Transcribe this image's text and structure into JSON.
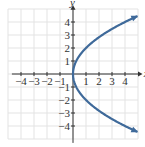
{
  "chart_data": {
    "type": "line",
    "title": "",
    "xlabel": "x",
    "ylabel": "y",
    "xlim": [
      -5,
      5
    ],
    "ylim": [
      -5,
      5
    ],
    "grid": true,
    "x_ticks": [
      "-4",
      "-3",
      "-2",
      "-1",
      "1",
      "2",
      "3",
      "4"
    ],
    "y_ticks": [
      "4",
      "3",
      "2",
      "1",
      "-1",
      "-2",
      "-3",
      "-4"
    ],
    "series": [
      {
        "name": "x = y^2/4",
        "color": "#3f6a9a",
        "points": [
          [
            4.9,
            4.45
          ],
          [
            4,
            4
          ],
          [
            2.25,
            3
          ],
          [
            1,
            2
          ],
          [
            0.25,
            1
          ],
          [
            0,
            0
          ],
          [
            0.25,
            -1
          ],
          [
            1,
            -2
          ],
          [
            2.25,
            -3
          ],
          [
            4,
            -4
          ],
          [
            4.9,
            -4.45
          ]
        ]
      }
    ]
  }
}
